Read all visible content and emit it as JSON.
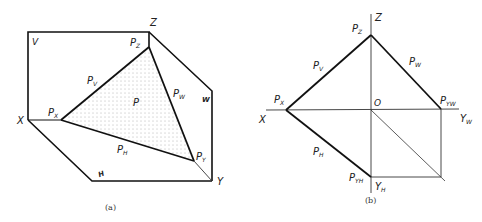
{
  "figure_a": {
    "caption": "(a)",
    "labels": {
      "v_plane": "V",
      "w_plane": "W",
      "h_plane": "H",
      "axis_x": "X",
      "axis_y": "Y",
      "axis_z": "Z",
      "plane_p": "P",
      "px": {
        "base": "P",
        "sub": "X"
      },
      "py": {
        "base": "P",
        "sub": "Y"
      },
      "pz": {
        "base": "P",
        "sub": "Z"
      },
      "pv": {
        "base": "P",
        "sub": "V"
      },
      "pw": {
        "base": "P",
        "sub": "W"
      },
      "ph": {
        "base": "P",
        "sub": "H"
      }
    }
  },
  "figure_b": {
    "caption": "(b)",
    "labels": {
      "axis_x": "X",
      "axis_z": "Z",
      "origin": "O",
      "axis_yw": {
        "base": "Y",
        "sub": "W"
      },
      "axis_yh": {
        "base": "Y",
        "sub": "H"
      },
      "px": {
        "base": "P",
        "sub": "X"
      },
      "pz": {
        "base": "P",
        "sub": "Z"
      },
      "pv": {
        "base": "P",
        "sub": "V"
      },
      "pw": {
        "base": "P",
        "sub": "W"
      },
      "ph": {
        "base": "P",
        "sub": "H"
      },
      "pyw": {
        "base": "P",
        "sub": "YW"
      },
      "pyh": {
        "base": "P",
        "sub": "YH"
      }
    }
  }
}
